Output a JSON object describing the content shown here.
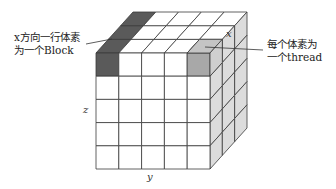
{
  "diagram": {
    "type": "voxel-grid-cube",
    "colors": {
      "line": "#3a3a3a",
      "face_front": "#ffffff",
      "face_top": "#ffffff",
      "face_side": "#dcdcdc",
      "block_highlight": "#5a5a5a",
      "thread_front": "#a8a8a8",
      "thread_top": "#c4c4c4",
      "thread_side": "#cfcfcf"
    },
    "grid": {
      "cols_y": 5,
      "rows_z": 5,
      "depth_x": 3
    }
  },
  "labels": {
    "block_note_line1": "x方向一行体素",
    "block_note_line2": "为一个Block",
    "thread_note_line1": "每个体素为",
    "thread_note_line2": "一个thread",
    "axis_x": "x",
    "axis_y": "y",
    "axis_z": "z"
  }
}
